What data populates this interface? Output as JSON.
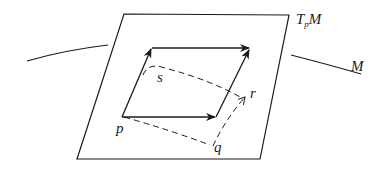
{
  "diagram": {
    "colors": {
      "stroke": "#1a1a1a",
      "background": "#ffffff"
    },
    "labels": {
      "tangent_plane": {
        "main": "T",
        "sub": "p",
        "tail": "M"
      },
      "manifold": "M",
      "p": "p",
      "q": "q",
      "r": "r",
      "s": "s"
    },
    "elements": {
      "tangent_plane": "parallelogram",
      "manifold_curve": "curved line passing behind the plane",
      "tangent_vectors": [
        "p → lower-right",
        "p → upper-left",
        "upper-left → upper-right",
        "lower-right → upper-right"
      ],
      "geodesic_path": [
        "p → q (dashed)",
        "q → r (dashed, arrow)",
        "s → r (dashed curve)",
        "p → s (dashed)"
      ]
    }
  }
}
